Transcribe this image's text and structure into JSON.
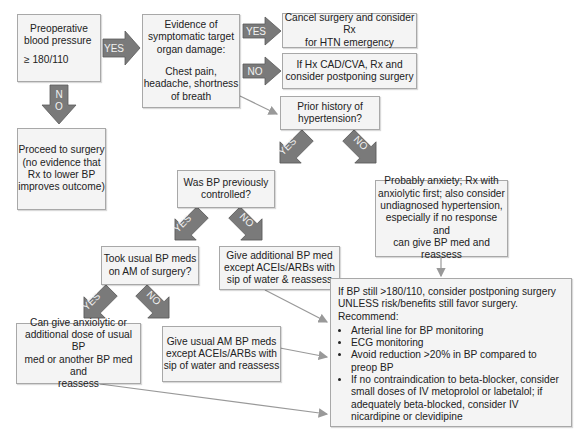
{
  "colors": {
    "box_fill": "#f4f4f4",
    "box_border": "#a8a8a8",
    "arrow_fill": "#7a7a7a",
    "arrow_border": "#5a5a5a",
    "connector": "#999999"
  },
  "nodes": {
    "preop": {
      "line1": "Preoperative",
      "line2": "blood pressure",
      "line3": "≥ 180/110"
    },
    "evidence": {
      "line1": "Evidence of",
      "line2": "symptomatic target",
      "line3": "organ damage:",
      "line4": "Chest pain,",
      "line5": "headache, shortness",
      "line6": "of breath"
    },
    "cancel": {
      "line1": "Cancel surgery and consider Rx",
      "line2": "for HTN emergency"
    },
    "hx": {
      "line1": "If Hx CAD/CVA, Rx and",
      "line2": "consider postponing surgery"
    },
    "prior": {
      "line1": "Prior history of",
      "line2": "hypertension?"
    },
    "proceed": {
      "line1": "Proceed to surgery",
      "line2": "(no evidence that",
      "line3": "Rx to lower BP",
      "line4": "improves outcome)"
    },
    "controlled": {
      "line1": "Was BP previously",
      "line2": "controlled?"
    },
    "anxiety": {
      "line1": "Probably anxiety; Rx with",
      "line2": "anxiolytic first; also consider",
      "line3": "undiagnosed hypertension,",
      "line4": "especially if no response and",
      "line5": "can give BP med and reassess"
    },
    "took": {
      "line1": "Took usual BP meds",
      "line2": "on AM of surgery?"
    },
    "additional": {
      "line1": "Give additional BP med",
      "line2": "except ACEIs/ARBs with",
      "line3": "sip of water & reassess"
    },
    "cangive": {
      "line1": "Can give anxiolytic or",
      "line2": "additional dose of usual BP",
      "line3": "med or another BP med and",
      "line4": "reassess"
    },
    "usualam": {
      "line1": "Give usual AM BP meds",
      "line2": "except ACEIs/ARBs with",
      "line3": "sip of water and reassess"
    },
    "final": {
      "line1": "If BP still >180/110, consider postponing surgery",
      "line2": "UNLESS risk/benefits still favor surgery.",
      "line3": "Recommend:",
      "bullets": [
        "Arterial line for BP monitoring",
        "ECG monitoring",
        "Avoid reduction >20% in BP compared to preop BP",
        "If no contraindication to beta-blocker, consider small doses of IV metoprolol or labetalol; if adequately beta-blocked, consider IV nicardipine or clevidipine"
      ]
    }
  },
  "arrows": {
    "preop_yes": "YES",
    "preop_no": "NO",
    "evidence_yes": "YES",
    "evidence_no": "NO",
    "prior_yes": "YES",
    "prior_no": "NO",
    "controlled_yes": "YES",
    "controlled_no": "NO",
    "took_yes": "YES",
    "took_no": "NO"
  }
}
